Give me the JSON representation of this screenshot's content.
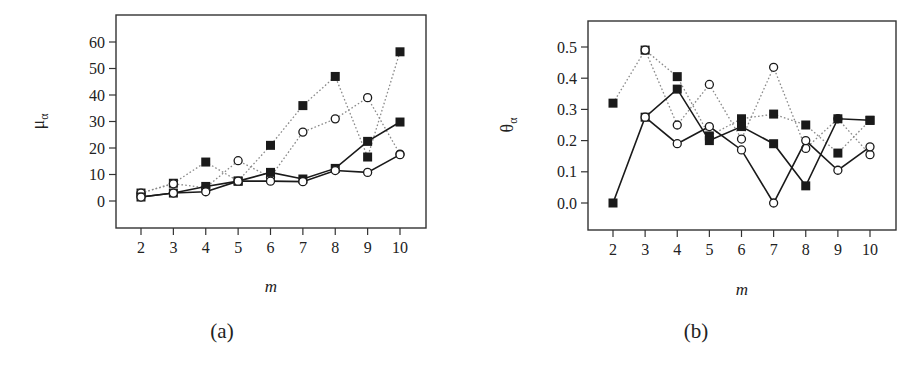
{
  "chart_data": [
    {
      "type": "line",
      "panel": "(a)",
      "xlabel": "m",
      "ylabel": "μ_α",
      "ylabel_main": "μ",
      "ylabel_sub": "α",
      "x": [
        2,
        3,
        4,
        5,
        6,
        7,
        8,
        9,
        10
      ],
      "xticks": [
        "2",
        "3",
        "4",
        "5",
        "6",
        "7",
        "8",
        "9",
        "10"
      ],
      "yticks": [
        "0",
        "10",
        "20",
        "30",
        "40",
        "50",
        "60"
      ],
      "ytick_values": [
        0,
        10,
        20,
        30,
        40,
        50,
        60
      ],
      "ylim": [
        -12,
        69
      ],
      "xlim": [
        1.2,
        10.8
      ],
      "grid": false,
      "legend": null,
      "series": [
        {
          "name": "dotted-square",
          "style": "dotted",
          "marker": "filled-square",
          "values": [
            3,
            6.7,
            14.7,
            7.5,
            21,
            36,
            47,
            16.6,
            56.3
          ]
        },
        {
          "name": "dotted-circle",
          "style": "dotted",
          "marker": "open-circle",
          "values": [
            3,
            6.5,
            5,
            15.2,
            9,
            26,
            31,
            39,
            17.7
          ]
        },
        {
          "name": "solid-square",
          "style": "solid",
          "marker": "filled-square",
          "values": [
            1.5,
            3,
            5.5,
            7.5,
            10.8,
            8.3,
            12.3,
            22.5,
            29.8
          ]
        },
        {
          "name": "solid-circle",
          "style": "solid",
          "marker": "open-circle",
          "values": [
            1.5,
            3,
            3.5,
            7.5,
            7.5,
            7.3,
            11.5,
            10.8,
            17.5
          ]
        }
      ]
    },
    {
      "type": "line",
      "panel": "(b)",
      "xlabel": "m",
      "ylabel": "θ_α",
      "ylabel_main": "θ",
      "ylabel_sub": "α",
      "x": [
        2,
        3,
        4,
        5,
        6,
        7,
        8,
        9,
        10
      ],
      "xticks": [
        "2",
        "3",
        "4",
        "5",
        "6",
        "7",
        "8",
        "9",
        "10"
      ],
      "yticks": [
        "0.0",
        "0.1",
        "0.2",
        "0.3",
        "0.4",
        "0.5"
      ],
      "ytick_values": [
        0,
        0.1,
        0.2,
        0.3,
        0.4,
        0.5
      ],
      "ylim": [
        -0.085,
        0.585
      ],
      "xlim": [
        1.2,
        10.8
      ],
      "grid": false,
      "legend": null,
      "series": [
        {
          "name": "dotted-square",
          "style": "dotted",
          "marker": "filled-square",
          "values": [
            0.32,
            0.49,
            0.405,
            0.215,
            0.27,
            0.285,
            0.25,
            0.16,
            0.265
          ]
        },
        {
          "name": "dotted-circle",
          "style": "dotted",
          "marker": "open-circle",
          "values": [
            null,
            0.49,
            0.25,
            0.38,
            0.205,
            0.435,
            0.175,
            0.27,
            0.155
          ]
        },
        {
          "name": "solid-square",
          "style": "solid",
          "marker": "filled-square",
          "values": [
            0.0,
            0.275,
            0.365,
            0.2,
            0.245,
            0.19,
            0.055,
            0.27,
            0.265
          ]
        },
        {
          "name": "solid-circle",
          "style": "solid",
          "marker": "open-circle",
          "values": [
            null,
            0.275,
            0.19,
            0.245,
            0.17,
            0.0,
            0.2,
            0.105,
            0.18
          ]
        }
      ]
    }
  ],
  "captions": {
    "a": "(a)",
    "b": "(b)"
  },
  "colors": {
    "ink": "#1a1a1a",
    "dotted": "#8a8a8a",
    "frame": "#333333"
  }
}
